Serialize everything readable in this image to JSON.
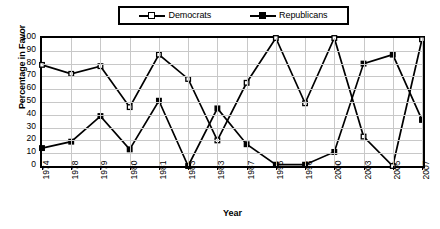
{
  "chart_data": {
    "type": "line",
    "title": "",
    "subtitle": "",
    "xlabel": "Year",
    "ylabel": "Percentage in Favor",
    "categories": [
      "1974",
      "1978",
      "1979",
      "1980",
      "1981",
      "1983",
      "1983",
      "1987",
      "1995",
      "1996",
      "2000",
      "2003",
      "2005",
      "2007"
    ],
    "series": [
      {
        "name": "Democrats",
        "marker": "open-square",
        "color": "#000000",
        "values": [
          79,
          72,
          78,
          46,
          87,
          68,
          20,
          65,
          100,
          49,
          100,
          23,
          0,
          99
        ]
      },
      {
        "name": "Republicans",
        "marker": "filled-square",
        "color": "#000000",
        "values": [
          14,
          19,
          39,
          13,
          51,
          0,
          45,
          17,
          1,
          1,
          11,
          80,
          87,
          36
        ]
      }
    ],
    "ylim": [
      0,
      100
    ],
    "ytick_labels": [
      "100",
      "90",
      "80",
      "70",
      "60",
      "50",
      "40",
      "30",
      "20",
      "10",
      "0"
    ],
    "ytick_values": [
      100,
      90,
      80,
      70,
      60,
      50,
      40,
      30,
      20,
      10,
      0
    ],
    "grid": "horizontal-and-vertical",
    "legend_position": "top-center",
    "plot_border": true
  },
  "legend": {
    "entries": [
      {
        "label": "Democrats"
      },
      {
        "label": "Republicans"
      }
    ]
  }
}
